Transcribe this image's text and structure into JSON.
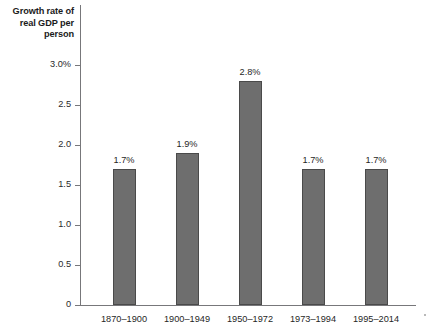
{
  "chart_data": {
    "type": "bar",
    "title": "",
    "ylabel": "Growth rate of real GDP per person",
    "ylabel_lines": [
      "Growth rate of",
      "real GDP per",
      "person"
    ],
    "xlabel": "",
    "categories": [
      "1870–1900",
      "1900–1949",
      "1950–1972",
      "1973–1994",
      "1995–2014"
    ],
    "values": [
      1.7,
      1.9,
      2.8,
      1.7,
      1.7
    ],
    "value_labels": [
      "1.7%",
      "1.9%",
      "2.8%",
      "1.7%",
      "1.7%"
    ],
    "ylim": [
      0,
      3.0
    ],
    "ytick_values": [
      3.0,
      2.5,
      2.0,
      1.5,
      1.0,
      0.5,
      0
    ],
    "ytick_labels": [
      "3.0%",
      "2.5",
      "2.0",
      "1.5",
      "1.0",
      "0.5",
      "0"
    ],
    "grid": false,
    "legend": null,
    "unit": "%",
    "bar_color": "#6e6e6e",
    "bar_border_color": "#4a4a4a",
    "axis_color": "#77777a",
    "background_color": "#ffffff"
  }
}
